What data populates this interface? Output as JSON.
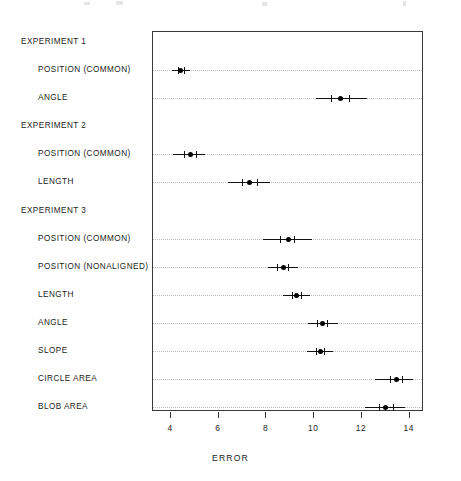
{
  "chart_data": {
    "type": "scatter",
    "title": "",
    "subtitle": "",
    "xlabel": "ERROR",
    "ylabel": "",
    "xlim": [
      3.25,
      14.6
    ],
    "xticks": [
      4,
      6,
      8,
      10,
      12,
      14
    ],
    "xticklabels": [
      "4",
      "6",
      "8",
      "10",
      "12",
      "14"
    ],
    "grid": "horizontal-dotted",
    "legend": "none",
    "orientation": "horizontal",
    "marker": "filled-circle-with-error-bars",
    "groups": [
      {
        "name": "EXPERIMENT 1",
        "rows": [
          {
            "label": "POSITION (COMMON)",
            "value": 4.46,
            "inner_low": 4.32,
            "inner_high": 4.6,
            "outer_low": 4.1,
            "outer_high": 4.85
          },
          {
            "label": "ANGLE",
            "value": 11.15,
            "inner_low": 10.75,
            "inner_high": 11.5,
            "outer_low": 10.1,
            "outer_high": 12.25
          }
        ]
      },
      {
        "name": "EXPERIMENT 2",
        "rows": [
          {
            "label": "POSITION (COMMON)",
            "value": 4.85,
            "inner_low": 4.6,
            "inner_high": 5.1,
            "outer_low": 4.15,
            "outer_high": 5.45
          },
          {
            "label": "LENGTH",
            "value": 7.35,
            "inner_low": 7.0,
            "inner_high": 7.65,
            "outer_low": 6.45,
            "outer_high": 8.2
          }
        ]
      },
      {
        "name": "EXPERIMENT 3",
        "rows": [
          {
            "label": "POSITION (COMMON)",
            "value": 8.95,
            "inner_low": 8.6,
            "inner_high": 9.2,
            "outer_low": 7.9,
            "outer_high": 9.95
          },
          {
            "label": "POSITION (NONALIGNED)",
            "value": 8.75,
            "inner_low": 8.5,
            "inner_high": 8.95,
            "outer_low": 8.1,
            "outer_high": 9.35
          },
          {
            "label": "LENGTH",
            "value": 9.3,
            "inner_low": 9.1,
            "inner_high": 9.5,
            "outer_low": 8.75,
            "outer_high": 9.85
          },
          {
            "label": "ANGLE",
            "value": 10.4,
            "inner_low": 10.15,
            "inner_high": 10.6,
            "outer_low": 9.8,
            "outer_high": 11.05
          },
          {
            "label": "SLOPE",
            "value": 10.3,
            "inner_low": 10.1,
            "inner_high": 10.45,
            "outer_low": 9.75,
            "outer_high": 10.85
          },
          {
            "label": "CIRCLE AREA",
            "value": 13.5,
            "inner_low": 13.2,
            "inner_high": 13.7,
            "outer_low": 12.6,
            "outer_high": 14.2
          },
          {
            "label": "BLOB AREA",
            "value": 13.05,
            "inner_low": 12.75,
            "inner_high": 13.35,
            "outer_low": 12.15,
            "outer_high": 13.85
          }
        ]
      }
    ]
  }
}
